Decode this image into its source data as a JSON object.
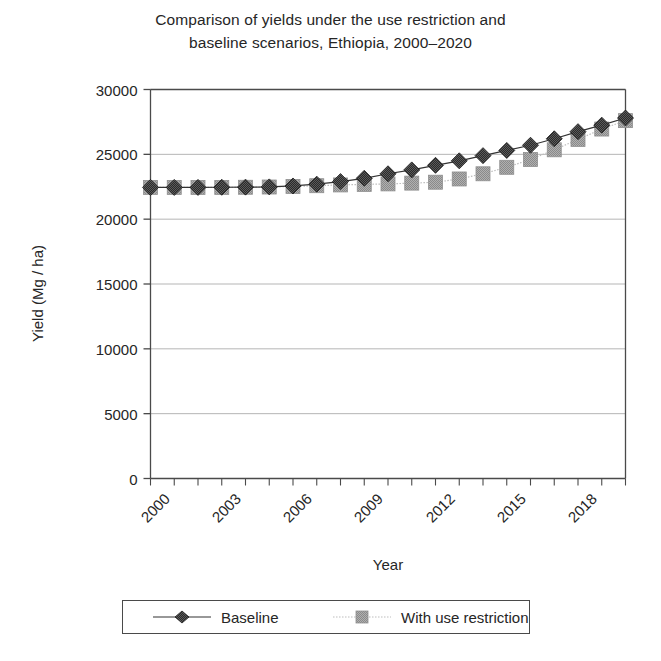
{
  "chart_data": {
    "type": "line",
    "title": "Comparison of yields under the use restriction and baseline scenarios, Ethiopia, 2000–2020",
    "title_lines": [
      "Comparison of yields under the use restriction and",
      "baseline scenarios, Ethiopia, 2000–2020"
    ],
    "xlabel": "Year",
    "ylabel": "Yield (Mg / ha)",
    "ylim": [
      0,
      30000
    ],
    "ytick_labels": [
      "0",
      "5000",
      "10000",
      "15000",
      "20000",
      "25000",
      "30000"
    ],
    "ytick_values": [
      0,
      5000,
      10000,
      15000,
      20000,
      25000,
      30000
    ],
    "xlim": [
      2000,
      2020
    ],
    "x": [
      2000,
      2001,
      2002,
      2003,
      2004,
      2005,
      2006,
      2007,
      2008,
      2009,
      2010,
      2011,
      2012,
      2013,
      2014,
      2015,
      2016,
      2017,
      2018,
      2019,
      2020
    ],
    "xtick_labels": [
      "2000",
      "2003",
      "2006",
      "2009",
      "2012",
      "2015",
      "2018"
    ],
    "xtick_values": [
      2000,
      2003,
      2006,
      2009,
      2012,
      2015,
      2018
    ],
    "xtick_rotation": -45,
    "grid": "horizontal",
    "legend_position": "below-axes",
    "series": [
      {
        "name": "Baseline",
        "marker": "diamond",
        "line_style": "solid",
        "color": "#333333",
        "values": [
          22450,
          22450,
          22450,
          22460,
          22470,
          22490,
          22560,
          22700,
          22900,
          23150,
          23500,
          23800,
          24150,
          24500,
          24900,
          25300,
          25700,
          26200,
          26750,
          27250,
          27800
        ]
      },
      {
        "name": "With use restriction",
        "marker": "square",
        "line_style": "dotted",
        "color": "#9a9a9a",
        "values": [
          22450,
          22450,
          22450,
          22450,
          22460,
          22480,
          22520,
          22580,
          22640,
          22680,
          22720,
          22780,
          22850,
          23100,
          23500,
          24000,
          24600,
          25350,
          26150,
          26950,
          27600
        ]
      }
    ]
  },
  "legend": {
    "entries": [
      {
        "label": "Baseline",
        "marker": "diamond-marker",
        "color": "#2b2b2b"
      },
      {
        "label": "With use restriction",
        "marker": "square-marker",
        "color": "#9a9a9a"
      }
    ]
  },
  "colors": {
    "baseline": "#333333",
    "restriction": "#9a9a9a",
    "axis": "#4a4a4a",
    "grid": "#b5b5b5",
    "text": "#262626"
  }
}
